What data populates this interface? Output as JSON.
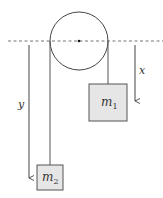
{
  "diagram": {
    "type": "atwood-machine",
    "pulley": {
      "cx": 79,
      "cy": 41,
      "r": 29
    },
    "reference_line": {
      "y": 41,
      "x1": 8,
      "x2": 163,
      "style": "dashed"
    },
    "masses": [
      {
        "id": "m1",
        "label": "m",
        "subscript": "1",
        "x": 89,
        "y": 84,
        "w": 38,
        "h": 37,
        "fill": "#e6e6e6"
      },
      {
        "id": "m2",
        "label": "m",
        "subscript": "2",
        "x": 37,
        "y": 165,
        "w": 26,
        "h": 25,
        "fill": "#e6e6e6"
      }
    ],
    "strings": [
      {
        "side": "right",
        "x": 108,
        "y1": 41,
        "y2": 84
      },
      {
        "side": "left",
        "x": 50,
        "y1": 41,
        "y2": 165
      }
    ],
    "arrows": [
      {
        "label": "x",
        "x": 135,
        "y1": 45,
        "y2": 101,
        "label_x": 139,
        "label_y": 73
      },
      {
        "label": "y",
        "x": 29,
        "y1": 45,
        "y2": 178,
        "label_x": 19,
        "label_y": 108
      }
    ]
  },
  "labels": {
    "x": "x",
    "y": "y",
    "m1": "m",
    "m1_sub": "1",
    "m2": "m",
    "m2_sub": "2"
  }
}
